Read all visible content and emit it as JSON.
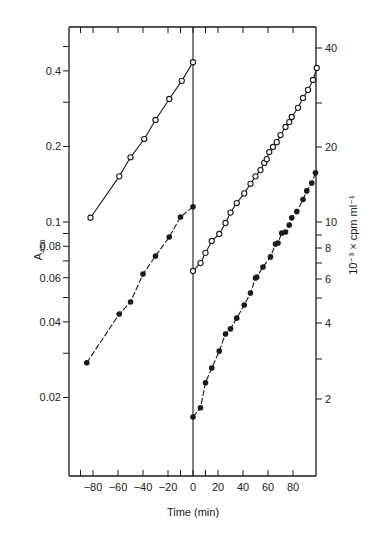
{
  "chart_data": {
    "type": "scatter",
    "title": "",
    "xlabel": "Time (min)",
    "ylabel": "A450",
    "ylabel_left_main": "A",
    "ylabel_left_sub": "450",
    "ylabel_right": "10⁻³ × cpm ml⁻¹",
    "y_scale": "log",
    "xlim": [
      -98,
      100
    ],
    "ylim": [
      0.01,
      0.6
    ],
    "grid": false,
    "legend": null,
    "x_ticks": [
      -80,
      -60,
      -40,
      -20,
      0,
      20,
      40,
      60,
      80
    ],
    "x_tick_labels": [
      "−80",
      "−60",
      "−40",
      "−20",
      "0",
      "20",
      "40",
      "60",
      "80"
    ],
    "x_minor_ticks": [
      -90,
      -10,
      10
    ],
    "y_left_ticks": [
      0.4,
      0.2,
      0.1,
      0.08,
      0.06,
      0.04,
      0.02
    ],
    "y_left_tick_labels": [
      "0.4",
      "0.2",
      "0.1",
      "0.08",
      "0.06",
      "0.04",
      "0.02"
    ],
    "y_left_minor_ticks": [
      0.5,
      0.3,
      0.09,
      0.07,
      0.05,
      0.03
    ],
    "y_right_ticks": [
      40,
      20,
      10,
      8,
      6,
      4,
      2
    ],
    "y_right_tick_labels": [
      "40",
      "20",
      "10",
      "8",
      "6",
      "4",
      "2"
    ],
    "annotations": [
      "vertical line at t = 0"
    ],
    "series": [
      {
        "name": "A450 before (open circles)",
        "marker": "open-circle",
        "axis": "left",
        "x": [
          -82,
          -59,
          -50,
          -39,
          -30,
          -19,
          -9,
          0
        ],
        "values": [
          0.104,
          0.152,
          0.181,
          0.214,
          0.255,
          0.309,
          0.365,
          0.433
        ]
      },
      {
        "name": "A450 after (open circles)",
        "marker": "open-circle",
        "axis": "left",
        "x": [
          0,
          6,
          10,
          15,
          21,
          26,
          30,
          35,
          41,
          46,
          50,
          54,
          57,
          59,
          61,
          64,
          67,
          70,
          74,
          77,
          79,
          84,
          88,
          92,
          96,
          99
        ],
        "values": [
          0.0638,
          0.0686,
          0.0753,
          0.084,
          0.0896,
          0.0991,
          0.109,
          0.119,
          0.13,
          0.142,
          0.152,
          0.161,
          0.172,
          0.178,
          0.19,
          0.199,
          0.208,
          0.222,
          0.239,
          0.25,
          0.262,
          0.285,
          0.312,
          0.336,
          0.368,
          0.411
        ]
      },
      {
        "name": "cpm before (filled circles)",
        "marker": "filled-circle",
        "axis": "right",
        "x": [
          -85,
          -59,
          -50,
          -40,
          -30,
          -19,
          -10,
          0
        ],
        "values": [
          2.75,
          4.3,
          4.8,
          6.2,
          7.32,
          8.71,
          10.47,
          11.5
        ]
      },
      {
        "name": "cpm after (filled circles)",
        "marker": "filled-circle",
        "axis": "right",
        "x": [
          0,
          6,
          10,
          15,
          21,
          26,
          30,
          35,
          41,
          46,
          50,
          51,
          56,
          62,
          66,
          68,
          71,
          74,
          77,
          79,
          83,
          88,
          91,
          95,
          98
        ],
        "values": [
          1.67,
          1.82,
          2.29,
          2.62,
          3.06,
          3.58,
          3.75,
          4.14,
          4.67,
          5.21,
          5.98,
          6.04,
          6.62,
          7.26,
          8.17,
          8.25,
          9.04,
          9.12,
          9.73,
          10.4,
          11.0,
          12.3,
          13.3,
          14.3,
          15.7
        ]
      }
    ]
  }
}
